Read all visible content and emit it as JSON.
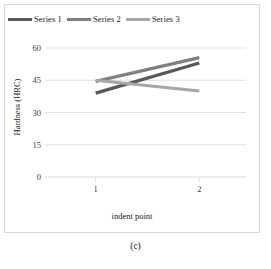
{
  "figure": {
    "caption": "(c)"
  },
  "chart_data": {
    "type": "line",
    "title": "",
    "xlabel": "indent point",
    "ylabel": "Hardness (HRC)",
    "categories": [
      "1",
      "2"
    ],
    "x": [
      1,
      2
    ],
    "xlim": [
      0.55,
      2.45
    ],
    "ylim": [
      0,
      60
    ],
    "yticks": [
      0,
      15,
      30,
      45,
      60
    ],
    "ytick_labels": [
      "0",
      "15",
      "30",
      "45",
      "60"
    ],
    "xticks": [
      1,
      2
    ],
    "xtick_labels": [
      "1",
      "2"
    ],
    "grid": "horizontal",
    "legend_position": "top-left",
    "series": [
      {
        "name": "Series 1",
        "color": "#595959",
        "values": [
          39,
          53
        ]
      },
      {
        "name": "Series 2",
        "color": "#808080",
        "values": [
          44.5,
          55.5
        ]
      },
      {
        "name": "Series 3",
        "color": "#a6a6a6",
        "values": [
          45,
          40
        ]
      }
    ]
  },
  "axes": {
    "y_title": "Hardness (HRC)",
    "x_title": "indent point",
    "y_ticks": [
      "60",
      "45",
      "30",
      "15",
      "0"
    ],
    "x_ticks": [
      "1",
      "2"
    ]
  },
  "legend": {
    "items": [
      {
        "label": "Series 1",
        "color": "#595959"
      },
      {
        "label": "Series 2",
        "color": "#808080"
      },
      {
        "label": "Series 3",
        "color": "#a6a6a6"
      }
    ]
  },
  "style": {
    "grid_color": "#d9d9d9",
    "frame_color": "#d9d9d9",
    "text_color": "#1a1a1a",
    "tick_color": "#404040",
    "background": "#ffffff"
  }
}
